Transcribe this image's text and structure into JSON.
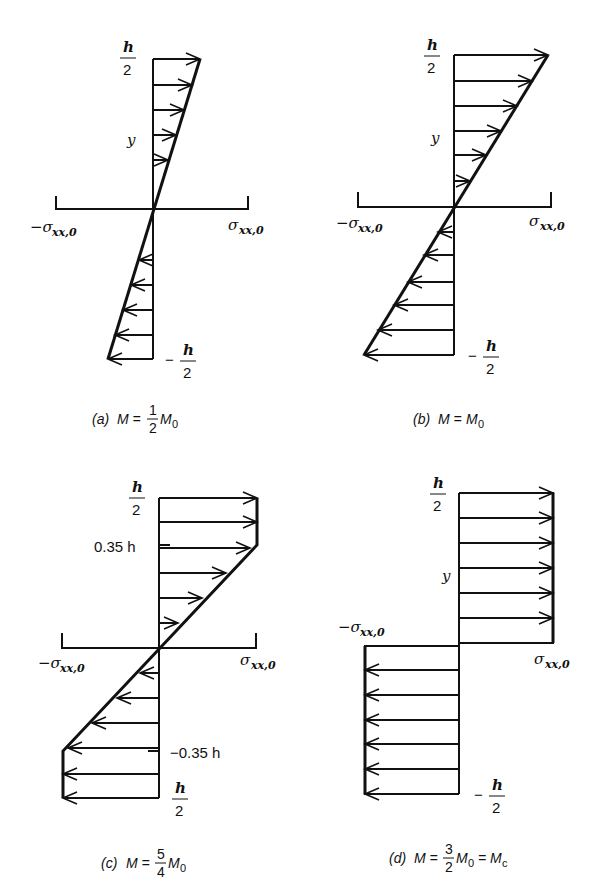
{
  "figure": {
    "panels": [
      {
        "id": "a",
        "caption_tag": "(a)",
        "caption_lhs": "M =",
        "caption_frac_num": "1",
        "caption_frac_den": "2",
        "caption_rhs": "M",
        "caption_rhs_sub": "0",
        "top_label_num": "h",
        "top_label_den": "2",
        "bottom_label_sign": "−",
        "bottom_label_num": "h",
        "bottom_label_den": "2",
        "y_label": "y",
        "left_axis_label": "−σ",
        "left_axis_sub": "xx,0",
        "right_axis_label": "σ",
        "right_axis_sub": "xx,0",
        "distribution": "linear, peak 0.5 σxx,0 at ±h/2"
      },
      {
        "id": "b",
        "caption_tag": "(b)",
        "caption_lhs": "M =",
        "caption_rhs": "M",
        "caption_rhs_sub": "0",
        "top_label_num": "h",
        "top_label_den": "2",
        "bottom_label_sign": "−",
        "bottom_label_num": "h",
        "bottom_label_den": "2",
        "y_label": "y",
        "left_axis_label": "−σ",
        "left_axis_sub": "xx,0",
        "right_axis_label": "σ",
        "right_axis_sub": "xx,0",
        "distribution": "linear, peak σxx,0 at ±h/2"
      },
      {
        "id": "c",
        "caption_tag": "(c)",
        "caption_lhs": "M =",
        "caption_frac_num": "5",
        "caption_frac_den": "4",
        "caption_rhs": "M",
        "caption_rhs_sub": "0",
        "top_label_num": "h",
        "top_label_den": "2",
        "bottom_label_num": "h",
        "bottom_label_den": "2",
        "upper_knee_label": "0.35 h",
        "lower_knee_label": "−0.35 h",
        "left_axis_label": "−σ",
        "left_axis_sub": "xx,0",
        "right_axis_label": "σ",
        "right_axis_sub": "xx,0",
        "distribution": "elastic core |y| < 0.35h, plastic σxx,0 beyond"
      },
      {
        "id": "d",
        "caption_tag": "(d)",
        "caption_lhs": "M =",
        "caption_frac_num": "3",
        "caption_frac_den": "2",
        "caption_rhs": "M",
        "caption_rhs_sub": "0",
        "caption_eq2": "= M",
        "caption_eq2_sub": "c",
        "top_label_num": "h",
        "top_label_den": "2",
        "bottom_label_sign": "−",
        "bottom_label_num": "h",
        "bottom_label_den": "2",
        "y_label": "y",
        "left_axis_label": "−σ",
        "left_axis_sub": "xx,0",
        "right_axis_label": "σ",
        "right_axis_sub": "xx,0",
        "distribution": "fully plastic, uniform ±σxx,0"
      }
    ]
  }
}
